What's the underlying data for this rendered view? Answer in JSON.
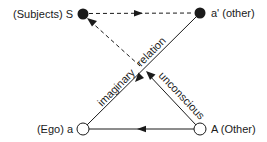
{
  "diagram": {
    "nodes": {
      "S": {
        "label": "(Subjects) S",
        "fill": "filled"
      },
      "a_prime": {
        "label": "a' (other)",
        "fill": "filled"
      },
      "a": {
        "label": "(Ego) a",
        "fill": "hollow"
      },
      "A": {
        "label": "A (Other)",
        "fill": "hollow"
      }
    },
    "edges": [
      {
        "from": "S",
        "to": "a'",
        "style": "dashed"
      },
      {
        "from": "a'",
        "to": "a",
        "style": "solid",
        "label": "imaginary relation"
      },
      {
        "from": "A",
        "to": "S",
        "style": "solid-then-dashed",
        "label": "unconscious"
      },
      {
        "from": "A",
        "to": "a",
        "style": "solid"
      }
    ],
    "edge_labels": {
      "imaginary": "imaginary",
      "relation": "relation",
      "unconscious": "unconscious"
    },
    "colors": {
      "line": "#1a1a1a",
      "background": "#ffffff"
    }
  }
}
